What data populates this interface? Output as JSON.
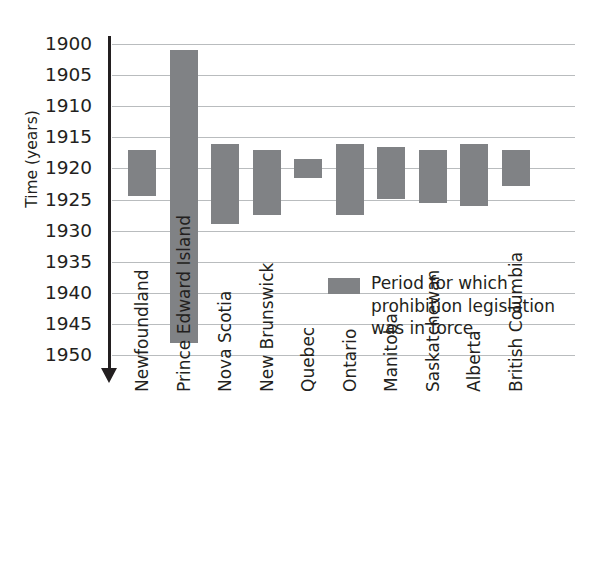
{
  "chart_data": {
    "type": "bar",
    "orientation": "vertical-range",
    "title": "",
    "subtitle": "",
    "xlabel": "",
    "ylabel": "Time (years)",
    "ylim": [
      1900,
      1950
    ],
    "y_inverted": true,
    "y_ticks": [
      1900,
      1905,
      1910,
      1915,
      1920,
      1925,
      1930,
      1935,
      1940,
      1945,
      1950
    ],
    "y_tick_labels": [
      "1900",
      "1905",
      "1910",
      "1915",
      "1920",
      "1925",
      "1930",
      "1935",
      "1940",
      "1945",
      "1950"
    ],
    "grid": true,
    "grid_axis": "y",
    "legend_position": "inside-center-right",
    "legend": [
      {
        "label": "Period for which prohibition legislation was in force",
        "label_lines": [
          "Period for which",
          "prohibition legislation",
          "was in force"
        ],
        "color": "#808285"
      }
    ],
    "categories": [
      "Newfoundland",
      "Prince Edward Island",
      "Nova Scotia",
      "New Brunswick",
      "Quebec",
      "Ontario",
      "Manitoba",
      "Saskatchewan",
      "Alberta",
      "British Columbia"
    ],
    "series": [
      {
        "name": "Period for which prohibition legislation was in force",
        "color": "#808285",
        "values": [
          {
            "category": "Newfoundland",
            "start": 1917.0,
            "end": 1924.5
          },
          {
            "category": "Prince Edward Island",
            "start": 1901.0,
            "end": 1948.0
          },
          {
            "category": "Nova Scotia",
            "start": 1916.0,
            "end": 1929.0
          },
          {
            "category": "New Brunswick",
            "start": 1917.0,
            "end": 1927.5
          },
          {
            "category": "Quebec",
            "start": 1918.5,
            "end": 1921.5
          },
          {
            "category": "Ontario",
            "start": 1916.0,
            "end": 1927.5
          },
          {
            "category": "Manitoba",
            "start": 1916.5,
            "end": 1925.0
          },
          {
            "category": "Saskatchewan",
            "start": 1917.0,
            "end": 1925.5
          },
          {
            "category": "Alberta",
            "start": 1916.0,
            "end": 1926.0
          },
          {
            "category": "British Columbia",
            "start": 1917.0,
            "end": 1922.8
          }
        ]
      }
    ],
    "colors": {
      "bar": "#808285",
      "grid": "#b9bcbe",
      "axis": "#231f20",
      "text": "#231f20",
      "background": "#ffffff"
    }
  },
  "axis": {
    "y_label": "Time (years)",
    "arrow_direction": "down"
  }
}
